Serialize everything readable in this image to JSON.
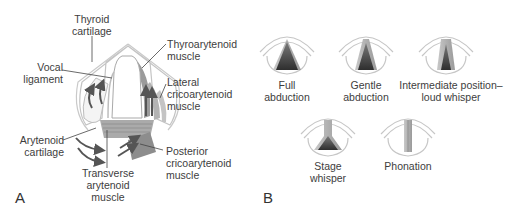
{
  "panel_a": {
    "letter": "A",
    "labels": {
      "thyroid_1": "Thyroid",
      "thyroid_2": "cartilage",
      "vocal_1": "Vocal",
      "vocal_2": "ligament",
      "thyroarytenoid_1": "Thyroarytenoid",
      "thyroarytenoid_2": "muscle",
      "lateral_1": "Lateral",
      "lateral_2": "cricoarytenoid",
      "lateral_3": "muscle",
      "arytenoid_1": "Arytenoid",
      "arytenoid_2": "cartilage",
      "posterior_1": "Posterior",
      "posterior_2": "cricoarytenoid",
      "posterior_3": "muscle",
      "transverse_1": "Transverse",
      "transverse_2": "arytenoid",
      "transverse_3": "muscle"
    }
  },
  "panel_b": {
    "letter": "B",
    "positions": [
      {
        "line1": "Full",
        "line2": "abduction"
      },
      {
        "line1": "Gentle",
        "line2": "abduction"
      },
      {
        "line1": "Intermediate position–",
        "line2": "loud whisper"
      },
      {
        "line1": "Stage",
        "line2": "whisper"
      },
      {
        "line1": "Phonation",
        "line2": ""
      }
    ]
  },
  "colors": {
    "outline": "#bdbdbd",
    "muscle": "#8a8a8a",
    "glottis_dark": "#3a3a3a",
    "text": "#3d3d3d"
  }
}
